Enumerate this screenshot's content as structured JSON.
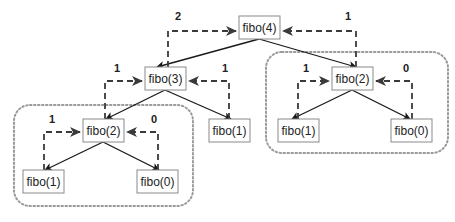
{
  "nodes": [
    {
      "id": "n4",
      "label": "fibo(4)",
      "x": 239,
      "y": 16
    },
    {
      "id": "n3",
      "label": "fibo(3)",
      "x": 145,
      "y": 67
    },
    {
      "id": "n2r",
      "label": "fibo(2)",
      "x": 332,
      "y": 67
    },
    {
      "id": "n2l",
      "label": "fibo(2)",
      "x": 83,
      "y": 119
    },
    {
      "id": "n1m",
      "label": "fibo(1)",
      "x": 209,
      "y": 119
    },
    {
      "id": "n1r",
      "label": "fibo(1)",
      "x": 278,
      "y": 119
    },
    {
      "id": "n0r",
      "label": "fibo(0)",
      "x": 391,
      "y": 119
    },
    {
      "id": "n1l",
      "label": "fibo(1)",
      "x": 23,
      "y": 170
    },
    {
      "id": "n0l",
      "label": "fibo(0)",
      "x": 137,
      "y": 170
    }
  ],
  "return_values": {
    "n3_to_n4": "2",
    "n2r_to_n4": "1",
    "n2l_to_n3": "1",
    "n1m_to_n3": "1",
    "n1r_to_n2r": "1",
    "n0r_to_n2r": "0",
    "n1l_to_n2l": "1",
    "n0l_to_n2l": "0"
  },
  "groups": [
    {
      "name": "right-fibo2-subtree",
      "x": 266,
      "y": 52,
      "w": 182,
      "h": 101
    },
    {
      "name": "left-fibo2-subtree",
      "x": 14,
      "y": 105,
      "w": 179,
      "h": 101
    }
  ],
  "colors": {
    "node_border": "#8a8a8a",
    "edge": "#1a1a1a",
    "return_arrow": "#3a3a3a",
    "group_border": "#9a9a9a"
  }
}
